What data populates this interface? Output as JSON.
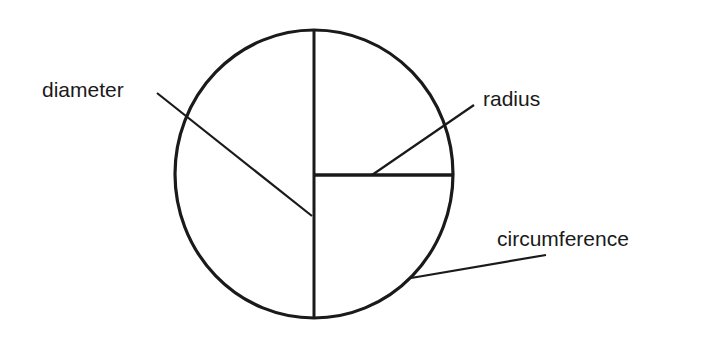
{
  "diagram": {
    "type": "labeled-circle",
    "colors": {
      "stroke": "#1a1a1a",
      "background": "#ffffff"
    },
    "labels": {
      "diameter": "diameter",
      "radius": "radius",
      "circumference": "circumference"
    }
  }
}
